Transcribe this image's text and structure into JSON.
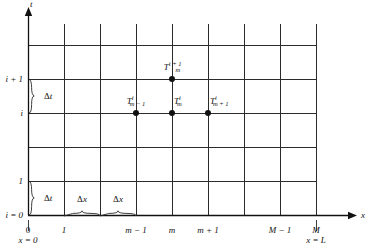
{
  "figure": {
    "type": "finite-difference-grid-diagram",
    "background_color": "#ffffff",
    "line_color": "#2b2b2b",
    "dot_color": "#111111"
  },
  "axes": {
    "x_axis": {
      "label": "x",
      "arrow": true,
      "y_px": 215,
      "x_start_px": 28,
      "x_end_px": 348
    },
    "y_axis": {
      "label": "t",
      "arrow": true,
      "x_px": 28,
      "y_start_px": 215,
      "y_end_px": 16
    }
  },
  "grid": {
    "vertical_lines_px": [
      28,
      64,
      100,
      136,
      172,
      208,
      244,
      280,
      316
    ],
    "horizontal_lines_px": [
      45,
      79,
      113,
      147,
      181,
      215
    ],
    "vertical_top_px": 24,
    "vertical_bottom_px": 215,
    "horizontal_left_px": 28,
    "horizontal_right_px": 316
  },
  "x_ticks": [
    {
      "label": "0",
      "x_px": 28,
      "italic": false
    },
    {
      "label": "1",
      "x_px": 64,
      "italic": true
    },
    {
      "label": "m − 1",
      "x_px": 136,
      "italic": true
    },
    {
      "label": "m",
      "x_px": 172,
      "italic": true
    },
    {
      "label": "m + 1",
      "x_px": 208,
      "italic": true
    },
    {
      "label": "M − 1",
      "x_px": 280,
      "italic": true
    },
    {
      "label": "M",
      "x_px": 316,
      "italic": true
    }
  ],
  "y_ticks": [
    {
      "label": "i + 1",
      "y_px": 79,
      "italic": true
    },
    {
      "label": "i",
      "y_px": 113,
      "italic": true
    },
    {
      "label": "1",
      "y_px": 181,
      "italic": true
    },
    {
      "label": "i = 0",
      "y_px": 215,
      "italic": true
    }
  ],
  "boundary_labels": [
    {
      "text": "x = 0",
      "x_px": 28,
      "y_px": 240,
      "tick_from_y": 220,
      "tick_to_y": 231
    },
    {
      "text": "x = L",
      "x_px": 316,
      "y_px": 240,
      "tick_from_y": 220,
      "tick_to_y": 231
    }
  ],
  "spacing_braces": [
    {
      "name": "delta-t-upper",
      "label": "Δt",
      "orientation": "vertical",
      "from_px": 79,
      "to_px": 113,
      "at_px": 28,
      "label_x_px": 44,
      "label_y_px": 96
    },
    {
      "name": "delta-t-lower",
      "label": "Δt",
      "orientation": "vertical",
      "from_px": 181,
      "to_px": 215,
      "at_px": 28,
      "label_x_px": 44,
      "label_y_px": 198
    },
    {
      "name": "delta-x-left",
      "label": "Δx",
      "orientation": "horizontal",
      "from_px": 64,
      "to_px": 100,
      "at_px": 215,
      "label_x_px": 82,
      "label_y_px": 199
    },
    {
      "name": "delta-x-right",
      "label": "Δx",
      "orientation": "horizontal",
      "from_px": 100,
      "to_px": 136,
      "at_px": 215,
      "label_x_px": 118,
      "label_y_px": 199
    }
  ],
  "nodes": [
    {
      "name": "node-T-m-i-plus-1",
      "base": "T",
      "sub": "m",
      "sup": "i + 1",
      "x_px": 172,
      "y_px": 79,
      "label_x_px": 172,
      "label_y_px": 67,
      "label_anchor": "center"
    },
    {
      "name": "node-T-m-minus-1-i",
      "base": "T",
      "sub": "m − 1",
      "sup": "i",
      "x_px": 136,
      "y_px": 113,
      "label_x_px": 136,
      "label_y_px": 101,
      "label_anchor": "center"
    },
    {
      "name": "node-T-m-i",
      "base": "T",
      "sub": "m",
      "sup": "i",
      "x_px": 172,
      "y_px": 113,
      "label_x_px": 174,
      "label_y_px": 101,
      "label_anchor": "left"
    },
    {
      "name": "node-T-m-plus-1-i",
      "base": "T",
      "sub": "m + 1",
      "sup": "i",
      "x_px": 208,
      "y_px": 113,
      "label_x_px": 210,
      "label_y_px": 101,
      "label_anchor": "left"
    }
  ],
  "chart_data": {
    "type": "scatter",
    "title": "",
    "xlabel": "x",
    "ylabel": "t",
    "x_tick_labels": [
      "0",
      "1",
      "m − 1",
      "m",
      "m + 1",
      "M − 1",
      "M"
    ],
    "y_tick_labels": [
      "i = 0",
      "1",
      "i",
      "i + 1"
    ],
    "grid": true,
    "legend": "none",
    "annotations": [
      "Δt",
      "Δt",
      "Δx",
      "Δx",
      "x = 0",
      "x = L"
    ],
    "points": [
      {
        "label": "T_m^{i+1}",
        "x_index": 4,
        "y_index": 3
      },
      {
        "label": "T_{m-1}^{i}",
        "x_index": 3,
        "y_index": 2
      },
      {
        "label": "T_m^{i}",
        "x_index": 4,
        "y_index": 2
      },
      {
        "label": "T_{m+1}^{i}",
        "x_index": 5,
        "y_index": 2
      }
    ]
  }
}
